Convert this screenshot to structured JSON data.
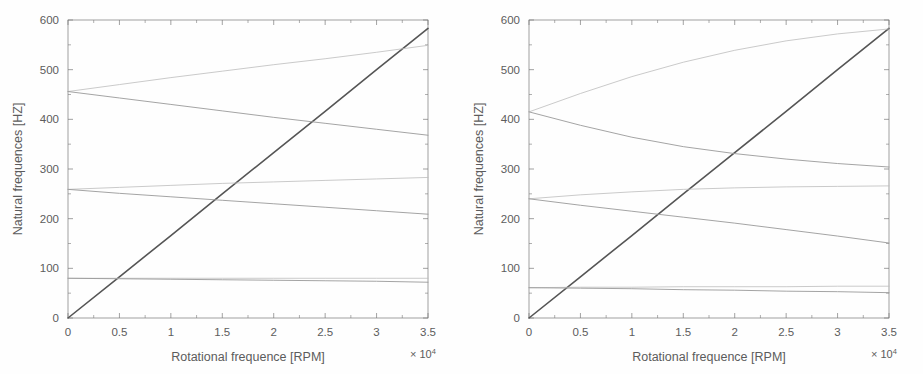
{
  "figure": {
    "kind": "campbell-diagram-pair",
    "background": "#ffffff",
    "line_color_primary": "#555555",
    "line_color_secondary": "#9a9a9a",
    "line_color_faint": "#bdbdbd",
    "axis_color": "#7a7a7a"
  },
  "axes": {
    "xlabel": "Rotational frequence [RPM]",
    "ylabel": "Natural frequences [HZ]",
    "x_exponent_prefix": "× 10",
    "x_exponent_power": "4",
    "xticks": [
      "0",
      "0.5",
      "1",
      "1.5",
      "2",
      "2.5",
      "3",
      "3.5"
    ],
    "yticks": [
      "0",
      "100",
      "200",
      "300",
      "400",
      "500",
      "600"
    ]
  },
  "chart_data": [
    {
      "type": "line",
      "panel": "left",
      "title": "",
      "xlabel": "Rotational frequence [RPM]",
      "ylabel": "Natural frequences [HZ]",
      "xlim": [
        0,
        35000
      ],
      "ylim": [
        0,
        600
      ],
      "xtick_values": [
        0,
        5000,
        10000,
        15000,
        20000,
        25000,
        30000,
        35000
      ],
      "ytick_values": [
        0,
        100,
        200,
        300,
        400,
        500,
        600
      ],
      "x_multiplier": 10000,
      "grid": false,
      "legend": "none",
      "x": [
        0,
        5000,
        10000,
        15000,
        20000,
        25000,
        30000,
        35000
      ],
      "series": [
        {
          "name": "1X excitation line",
          "style": "solid-dark",
          "values": [
            0,
            83,
            166,
            250,
            333,
            416,
            500,
            583
          ]
        },
        {
          "name": "Mode 3 forward whirl",
          "style": "solid-faint",
          "values": [
            456,
            470,
            484,
            497,
            510,
            522,
            535,
            549
          ]
        },
        {
          "name": "Mode 3 backward whirl",
          "style": "solid-mid",
          "values": [
            456,
            443,
            430,
            417,
            404,
            392,
            380,
            368
          ]
        },
        {
          "name": "Mode 2 forward whirl",
          "style": "solid-faint",
          "values": [
            259,
            263,
            267,
            271,
            274,
            277,
            280,
            283
          ]
        },
        {
          "name": "Mode 2 backward whirl",
          "style": "solid-mid",
          "values": [
            259,
            251,
            244,
            237,
            230,
            223,
            216,
            209
          ]
        },
        {
          "name": "Mode 1 forward whirl",
          "style": "solid-faint",
          "values": [
            80,
            80,
            80,
            80,
            80,
            80,
            80,
            80
          ]
        },
        {
          "name": "Mode 1 backward whirl",
          "style": "solid-mid",
          "values": [
            80,
            79,
            78,
            77,
            76,
            75,
            74,
            72
          ]
        }
      ]
    },
    {
      "type": "line",
      "panel": "right",
      "title": "",
      "xlabel": "Rotational frequence [RPM]",
      "ylabel": "Natural frequences [HZ]",
      "xlim": [
        0,
        35000
      ],
      "ylim": [
        0,
        600
      ],
      "xtick_values": [
        0,
        5000,
        10000,
        15000,
        20000,
        25000,
        30000,
        35000
      ],
      "ytick_values": [
        0,
        100,
        200,
        300,
        400,
        500,
        600
      ],
      "x_multiplier": 10000,
      "grid": false,
      "legend": "none",
      "x": [
        0,
        5000,
        10000,
        15000,
        20000,
        25000,
        30000,
        35000
      ],
      "series": [
        {
          "name": "1X excitation line",
          "style": "solid-dark",
          "values": [
            0,
            83,
            166,
            250,
            333,
            416,
            500,
            583
          ]
        },
        {
          "name": "Mode 3 forward whirl",
          "style": "solid-faint",
          "values": [
            415,
            452,
            486,
            515,
            539,
            558,
            572,
            582
          ]
        },
        {
          "name": "Mode 3 backward whirl",
          "style": "solid-mid",
          "values": [
            415,
            388,
            364,
            345,
            331,
            320,
            311,
            304
          ]
        },
        {
          "name": "Mode 2 forward whirl",
          "style": "solid-faint",
          "values": [
            240,
            248,
            254,
            259,
            262,
            264,
            265,
            266
          ]
        },
        {
          "name": "Mode 2 backward whirl",
          "style": "solid-mid",
          "values": [
            240,
            227,
            215,
            203,
            191,
            178,
            165,
            151
          ]
        },
        {
          "name": "Mode 1 forward whirl",
          "style": "solid-faint",
          "values": [
            61,
            62,
            62,
            63,
            63,
            63,
            64,
            64
          ]
        },
        {
          "name": "Mode 1 backward whirl",
          "style": "solid-mid",
          "values": [
            61,
            60,
            59,
            57,
            56,
            54,
            53,
            51
          ]
        }
      ]
    }
  ]
}
